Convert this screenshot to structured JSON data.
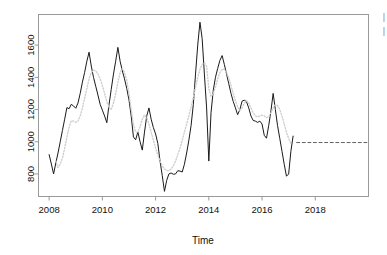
{
  "figure": {
    "kind": "time-series-forecast-plot",
    "background": "#ffffff",
    "box_color": "#9a9a9a"
  },
  "axes": {
    "x_title": "Time",
    "y_title": "",
    "x_ticks": [
      "2008",
      "2010",
      "2012",
      "2014",
      "2016",
      "2018"
    ],
    "y_ticks": [
      "800",
      "1000",
      "1200",
      "1400",
      "1600"
    ]
  },
  "chart_data": {
    "type": "line",
    "title": "",
    "xlabel": "Time",
    "ylabel": "",
    "xlim": [
      2007.6,
      2020.0
    ],
    "ylim": [
      660,
      1790
    ],
    "grid": false,
    "legend": "none",
    "x_ticks": [
      2008,
      2010,
      2012,
      2014,
      2016,
      2018
    ],
    "y_ticks": [
      800,
      1000,
      1200,
      1400,
      1600
    ],
    "series": [
      {
        "name": "observed",
        "style": "solid",
        "color": "#1a1a1a",
        "width": 1,
        "x": [
          2008.0,
          2008.083,
          2008.167,
          2008.25,
          2008.333,
          2008.417,
          2008.5,
          2008.583,
          2008.667,
          2008.75,
          2008.833,
          2008.917,
          2009.0,
          2009.083,
          2009.167,
          2009.25,
          2009.333,
          2009.417,
          2009.5,
          2009.583,
          2009.667,
          2009.75,
          2009.833,
          2009.917,
          2010.0,
          2010.083,
          2010.167,
          2010.25,
          2010.333,
          2010.417,
          2010.5,
          2010.583,
          2010.667,
          2010.75,
          2010.833,
          2010.917,
          2011.0,
          2011.083,
          2011.167,
          2011.25,
          2011.333,
          2011.417,
          2011.5,
          2011.583,
          2011.667,
          2011.75,
          2011.833,
          2011.917,
          2012.0,
          2012.083,
          2012.167,
          2012.25,
          2012.333,
          2012.417,
          2012.5,
          2012.583,
          2012.667,
          2012.75,
          2012.833,
          2012.917,
          2013.0,
          2013.083,
          2013.167,
          2013.25,
          2013.333,
          2013.417,
          2013.5,
          2013.583,
          2013.667,
          2013.75,
          2013.833,
          2013.917,
          2014.0,
          2014.083,
          2014.167,
          2014.25,
          2014.333,
          2014.417,
          2014.5,
          2014.583,
          2014.667,
          2014.75,
          2014.833,
          2014.917,
          2015.0,
          2015.083,
          2015.167,
          2015.25,
          2015.333,
          2015.417,
          2015.5,
          2015.583,
          2015.667,
          2015.75,
          2015.833,
          2015.917,
          2016.0,
          2016.083,
          2016.167,
          2016.25,
          2016.333,
          2016.417,
          2016.5,
          2016.583,
          2016.667,
          2016.75,
          2016.833,
          2016.917,
          2017.0,
          2017.083,
          2017.167
        ],
        "y": [
          920,
          862,
          800,
          868,
          930,
          1000,
          1070,
          1140,
          1212,
          1205,
          1232,
          1222,
          1208,
          1240,
          1300,
          1370,
          1430,
          1500,
          1556,
          1470,
          1400,
          1345,
          1290,
          1232,
          1196,
          1160,
          1118,
          1230,
          1325,
          1420,
          1500,
          1586,
          1500,
          1440,
          1390,
          1330,
          1260,
          1160,
          1030,
          1012,
          1060,
          1000,
          948,
          1060,
          1160,
          1210,
          1140,
          1088,
          1048,
          990,
          880,
          790,
          692,
          760,
          800,
          806,
          798,
          800,
          820,
          818,
          812,
          860,
          930,
          1010,
          1100,
          1230,
          1420,
          1600,
          1742,
          1640,
          1420,
          1210,
          880,
          1180,
          1320,
          1400,
          1455,
          1505,
          1535,
          1480,
          1420,
          1360,
          1300,
          1250,
          1210,
          1168,
          1200,
          1252,
          1258,
          1248,
          1210,
          1160,
          1132,
          1128,
          1120,
          1128,
          1110,
          1040,
          1022,
          1100,
          1190,
          1300,
          1200,
          1100,
          1020,
          940,
          860,
          786,
          800,
          940,
          1035
        ]
      },
      {
        "name": "fitted",
        "style": "dotted",
        "color": "#cfcfcf",
        "width": 1.4,
        "x": [
          2008.25,
          2008.333,
          2008.417,
          2008.5,
          2008.583,
          2008.667,
          2008.75,
          2008.833,
          2008.917,
          2009.0,
          2009.083,
          2009.167,
          2009.25,
          2009.333,
          2009.417,
          2009.5,
          2009.583,
          2009.667,
          2009.75,
          2009.833,
          2009.917,
          2010.0,
          2010.083,
          2010.167,
          2010.25,
          2010.333,
          2010.417,
          2010.5,
          2010.583,
          2010.667,
          2010.75,
          2010.833,
          2010.917,
          2011.0,
          2011.083,
          2011.167,
          2011.25,
          2011.333,
          2011.417,
          2011.5,
          2011.583,
          2011.667,
          2011.75,
          2011.833,
          2011.917,
          2012.0,
          2012.083,
          2012.167,
          2012.25,
          2012.333,
          2012.417,
          2012.5,
          2012.583,
          2012.667,
          2012.75,
          2012.833,
          2012.917,
          2013.0,
          2013.083,
          2013.167,
          2013.25,
          2013.333,
          2013.417,
          2013.5,
          2013.583,
          2013.667,
          2013.75,
          2013.833,
          2013.917,
          2014.0,
          2014.083,
          2014.167,
          2014.25,
          2014.333,
          2014.417,
          2014.5,
          2014.583,
          2014.667,
          2014.75,
          2014.833,
          2014.917,
          2015.0,
          2015.083,
          2015.167,
          2015.25,
          2015.333,
          2015.417,
          2015.5,
          2015.583,
          2015.667,
          2015.75,
          2015.833,
          2015.917,
          2016.0,
          2016.083,
          2016.167,
          2016.25,
          2016.333,
          2016.417,
          2016.5,
          2016.583,
          2016.667,
          2016.75,
          2016.833,
          2016.917,
          2017.0,
          2017.083
        ],
        "y": [
          880,
          840,
          860,
          900,
          960,
          1030,
          1090,
          1130,
          1128,
          1120,
          1128,
          1160,
          1210,
          1270,
          1330,
          1390,
          1430,
          1445,
          1440,
          1420,
          1390,
          1350,
          1300,
          1250,
          1210,
          1200,
          1240,
          1300,
          1370,
          1430,
          1455,
          1430,
          1380,
          1300,
          1200,
          1110,
          1060,
          1060,
          1095,
          1140,
          1165,
          1150,
          1110,
          1060,
          1010,
          960,
          920,
          880,
          850,
          830,
          822,
          820,
          830,
          850,
          880,
          920,
          960,
          1010,
          1060,
          1110,
          1160,
          1215,
          1275,
          1340,
          1400,
          1450,
          1480,
          1490,
          1470,
          1330,
          1280,
          1300,
          1340,
          1390,
          1430,
          1450,
          1450,
          1430,
          1395,
          1350,
          1300,
          1255,
          1215,
          1195,
          1210,
          1240,
          1255,
          1240,
          1210,
          1180,
          1160,
          1155,
          1160,
          1165,
          1160,
          1150,
          1155,
          1180,
          1210,
          1230,
          1225,
          1200,
          1160,
          1110,
          1060,
          1020,
          990
        ]
      },
      {
        "name": "forecast",
        "style": "dashed",
        "color": "#606060",
        "width": 1,
        "x": [
          2017.3,
          2020.0
        ],
        "y": [
          995,
          995
        ]
      }
    ]
  },
  "edge_marks": {
    "top": "|",
    "bottom": "|"
  }
}
